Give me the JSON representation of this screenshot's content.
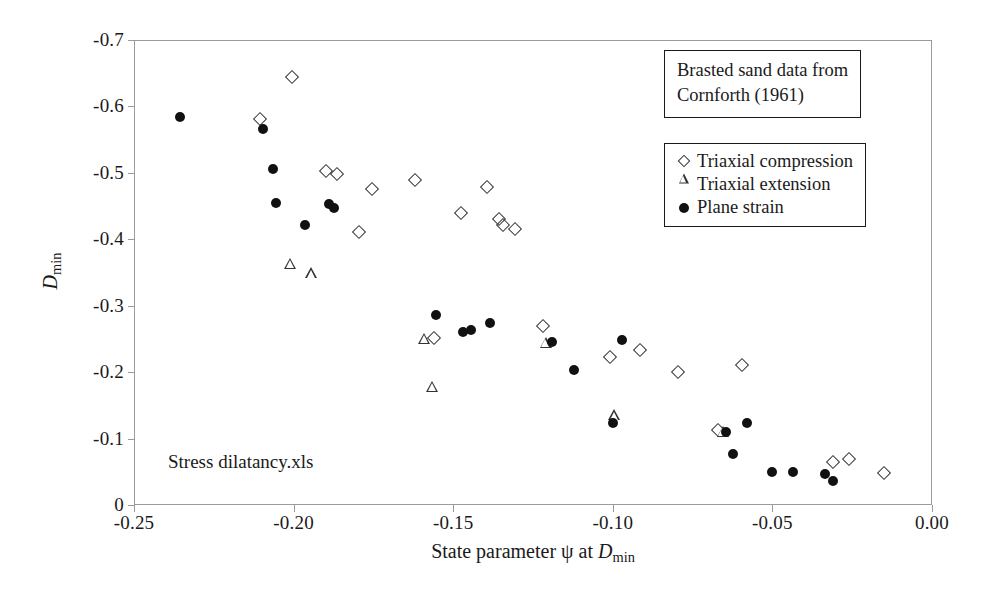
{
  "chart_data": {
    "type": "scatter",
    "title": "",
    "xlabel": "State parameter ψ at D_min",
    "ylabel": "D_min",
    "xlim": [
      -0.25,
      0.0
    ],
    "ylim": [
      -0.7,
      0.0
    ],
    "grid": false,
    "legend_position": "top-right",
    "xticks": [
      "-0.25",
      "-0.20",
      "-0.15",
      "-0.10",
      "-0.05",
      "0.00"
    ],
    "xtick_values": [
      -0.25,
      -0.2,
      -0.15,
      -0.1,
      -0.05,
      0.0
    ],
    "yticks": [
      "-0.7",
      "-0.6",
      "-0.5",
      "-0.4",
      "-0.3",
      "-0.2",
      "-0.1",
      "0"
    ],
    "ytick_values": [
      -0.7,
      -0.6,
      -0.5,
      -0.4,
      -0.3,
      -0.2,
      -0.1,
      0.0
    ],
    "annotation": "Stress dilatancy.xls",
    "source_note": [
      "Brasted sand data from",
      "Cornforth (1961)"
    ],
    "series": [
      {
        "name": "Triaxial compression",
        "marker": "open-diamond",
        "points": [
          [
            -0.2005,
            -0.645
          ],
          [
            -0.2105,
            -0.581
          ],
          [
            -0.19,
            -0.503
          ],
          [
            -0.1865,
            -0.4985
          ],
          [
            -0.1755,
            -0.4755
          ],
          [
            -0.162,
            -0.489
          ],
          [
            -0.1795,
            -0.4105
          ],
          [
            -0.1475,
            -0.4395
          ],
          [
            -0.1395,
            -0.479
          ],
          [
            -0.1345,
            -0.4215
          ],
          [
            -0.1355,
            -0.431
          ],
          [
            -0.1305,
            -0.4155
          ],
          [
            -0.156,
            -0.251
          ],
          [
            -0.122,
            -0.27
          ],
          [
            -0.101,
            -0.223
          ],
          [
            -0.0915,
            -0.233
          ],
          [
            -0.0795,
            -0.2005
          ],
          [
            -0.067,
            -0.1125
          ],
          [
            -0.0595,
            -0.211
          ],
          [
            -0.031,
            -0.065
          ],
          [
            -0.026,
            -0.069
          ],
          [
            -0.015,
            -0.0475
          ]
        ]
      },
      {
        "name": "Triaxial extension",
        "marker": "open-triangle",
        "points": [
          [
            -0.201,
            -0.363
          ],
          [
            -0.1945,
            -0.349
          ],
          [
            -0.159,
            -0.25
          ],
          [
            -0.1565,
            -0.1775
          ],
          [
            -0.121,
            -0.244
          ],
          [
            -0.0995,
            -0.135
          ],
          [
            -0.0655,
            -0.11
          ]
        ]
      },
      {
        "name": "Plane strain",
        "marker": "filled-circle",
        "points": [
          [
            -0.2355,
            -0.5845
          ],
          [
            -0.2095,
            -0.5655
          ],
          [
            -0.2065,
            -0.5055
          ],
          [
            -0.2055,
            -0.4545
          ],
          [
            -0.1965,
            -0.421
          ],
          [
            -0.189,
            -0.453
          ],
          [
            -0.1875,
            -0.4465
          ],
          [
            -0.1555,
            -0.2855
          ],
          [
            -0.147,
            -0.2605
          ],
          [
            -0.1445,
            -0.264
          ],
          [
            -0.1385,
            -0.2735
          ],
          [
            -0.119,
            -0.2455
          ],
          [
            -0.112,
            -0.203
          ],
          [
            -0.1,
            -0.1235
          ],
          [
            -0.097,
            -0.249
          ],
          [
            -0.0645,
            -0.1095
          ],
          [
            -0.0625,
            -0.077
          ],
          [
            -0.058,
            -0.1235
          ],
          [
            -0.05,
            -0.049
          ],
          [
            -0.0435,
            -0.049
          ],
          [
            -0.0335,
            -0.046
          ],
          [
            -0.031,
            -0.0355
          ]
        ]
      }
    ]
  },
  "legend": {
    "entries": [
      {
        "label": "Triaxial compression",
        "marker": "open-diamond"
      },
      {
        "label": "Triaxial extension",
        "marker": "open-triangle"
      },
      {
        "label": "Plane strain",
        "marker": "filled-circle"
      }
    ]
  },
  "axis": {
    "y_title_main": "D",
    "y_title_sub": "min",
    "x_title_prefix": "State parameter ψ at ",
    "x_title_var": "D",
    "x_title_sub": "min"
  },
  "colors": {
    "marker_fill": "#111111",
    "marker_stroke": "#333333",
    "frame": "#9a9a9a",
    "text": "#1a1a1a",
    "background": "#ffffff"
  }
}
